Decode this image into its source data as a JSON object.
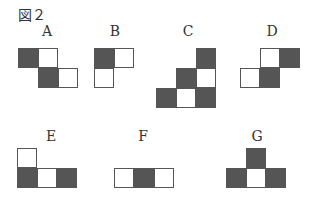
{
  "figure": {
    "title": "図２",
    "colors": {
      "dark": "#555555",
      "light": "#ffffff",
      "border": "#555555"
    },
    "shapes": [
      {
        "label": "A",
        "label_pos": [
          37,
          23
        ],
        "cells": [
          {
            "x": 18,
            "y": 48,
            "fill": "dark"
          },
          {
            "x": 38,
            "y": 48,
            "fill": "light"
          },
          {
            "x": 38,
            "y": 68,
            "fill": "dark"
          },
          {
            "x": 58,
            "y": 68,
            "fill": "light"
          }
        ]
      },
      {
        "label": "B",
        "label_pos": [
          105,
          23
        ],
        "cells": [
          {
            "x": 94,
            "y": 48,
            "fill": "dark"
          },
          {
            "x": 114,
            "y": 48,
            "fill": "light"
          },
          {
            "x": 94,
            "y": 68,
            "fill": "light"
          }
        ]
      },
      {
        "label": "C",
        "label_pos": [
          178,
          23
        ],
        "cells": [
          {
            "x": 196,
            "y": 48,
            "fill": "dark"
          },
          {
            "x": 176,
            "y": 68,
            "fill": "dark"
          },
          {
            "x": 196,
            "y": 68,
            "fill": "light"
          },
          {
            "x": 156,
            "y": 88,
            "fill": "dark"
          },
          {
            "x": 176,
            "y": 88,
            "fill": "light"
          },
          {
            "x": 196,
            "y": 88,
            "fill": "dark"
          }
        ]
      },
      {
        "label": "D",
        "label_pos": [
          262,
          23
        ],
        "cells": [
          {
            "x": 260,
            "y": 48,
            "fill": "light"
          },
          {
            "x": 280,
            "y": 48,
            "fill": "dark"
          },
          {
            "x": 240,
            "y": 68,
            "fill": "light"
          },
          {
            "x": 260,
            "y": 68,
            "fill": "dark"
          }
        ]
      },
      {
        "label": "E",
        "label_pos": [
          41,
          128
        ],
        "cells": [
          {
            "x": 17,
            "y": 148,
            "fill": "light"
          },
          {
            "x": 17,
            "y": 168,
            "fill": "dark"
          },
          {
            "x": 37,
            "y": 168,
            "fill": "light"
          },
          {
            "x": 57,
            "y": 168,
            "fill": "dark"
          }
        ]
      },
      {
        "label": "F",
        "label_pos": [
          133,
          128
        ],
        "cells": [
          {
            "x": 114,
            "y": 168,
            "fill": "light"
          },
          {
            "x": 134,
            "y": 168,
            "fill": "dark"
          },
          {
            "x": 154,
            "y": 168,
            "fill": "light"
          }
        ]
      },
      {
        "label": "G",
        "label_pos": [
          247,
          128
        ],
        "cells": [
          {
            "x": 246,
            "y": 148,
            "fill": "dark"
          },
          {
            "x": 226,
            "y": 168,
            "fill": "dark"
          },
          {
            "x": 246,
            "y": 168,
            "fill": "light"
          },
          {
            "x": 266,
            "y": 168,
            "fill": "dark"
          }
        ]
      }
    ]
  }
}
